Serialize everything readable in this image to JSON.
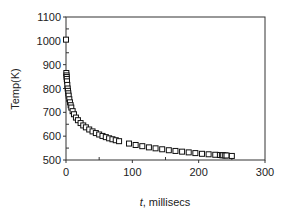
{
  "chart_data": {
    "type": "scatter",
    "title": "",
    "xlabel_italic": "t",
    "xlabel_rest": ", millisecs",
    "xlabel": "t, millisecs",
    "ylabel": "Temp(K)",
    "xlim": [
      0,
      300
    ],
    "ylim": [
      500,
      1100
    ],
    "xticks": [
      0,
      100,
      200,
      300
    ],
    "yticks": [
      500,
      600,
      700,
      800,
      900,
      1000,
      1100
    ],
    "grid": false,
    "legend": null,
    "marker": "open-square",
    "series": [
      {
        "name": "Temp",
        "x": [
          0,
          0.5,
          0.8,
          1.0,
          1.2,
          1.5,
          2,
          2.5,
          3,
          3.5,
          4,
          5,
          6,
          7,
          8,
          10,
          12,
          15,
          18,
          22,
          26,
          30,
          35,
          40,
          45,
          50,
          55,
          60,
          65,
          70,
          75,
          80,
          95,
          105,
          115,
          125,
          135,
          145,
          155,
          165,
          175,
          185,
          195,
          205,
          215,
          225,
          232,
          235,
          237,
          240,
          242,
          250
        ],
        "y": [
          1005,
          865,
          855,
          848,
          840,
          830,
          815,
          800,
          790,
          780,
          770,
          755,
          742,
          730,
          720,
          705,
          692,
          678,
          667,
          655,
          645,
          637,
          628,
          620,
          613,
          607,
          601,
          596,
          591,
          587,
          583,
          579,
          569,
          563,
          558,
          553,
          549,
          545,
          541,
          538,
          535,
          532,
          529,
          526,
          524,
          522,
          521,
          520,
          520,
          519,
          519,
          517
        ]
      }
    ]
  }
}
